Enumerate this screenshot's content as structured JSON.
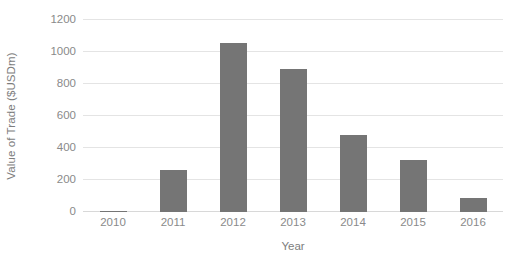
{
  "chart_data": {
    "type": "bar",
    "title": "",
    "subtitle": "",
    "xlabel": "Year",
    "ylabel": "Value of Trade ($USDm)",
    "categories": [
      "2010",
      "2011",
      "2012",
      "2013",
      "2014",
      "2015",
      "2016"
    ],
    "values": [
      8,
      263,
      1056,
      895,
      481,
      325,
      88
    ],
    "series": [
      {
        "name": "Value of Trade",
        "values": [
          8,
          263,
          1056,
          895,
          481,
          325,
          88
        ]
      }
    ],
    "ylim": [
      0,
      1200
    ],
    "yticks": [
      0,
      200,
      400,
      600,
      800,
      1000,
      1200
    ],
    "ytick_labels": [
      "0",
      "200",
      "400",
      "600",
      "800",
      "1000",
      "1200"
    ],
    "grid": true,
    "grid_axis": "y",
    "legend": false,
    "legend_position": "none",
    "bar_color": "#757575",
    "gridline_color": "#e4e4e4",
    "axis_text_color": "#8a8a8a",
    "background_color": "#ffffff",
    "annotations": []
  }
}
